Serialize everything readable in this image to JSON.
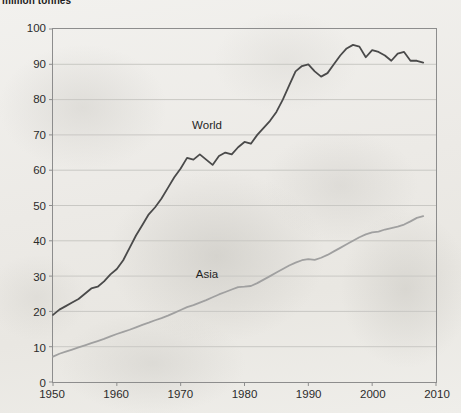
{
  "chart": {
    "title": "million tonnes"
  },
  "labels": {
    "world": "World",
    "asia": "Asia"
  },
  "colors": {
    "world_line": "#4a4a4a",
    "asia_line": "#a0a0a0",
    "gridline": "#c9c8c4",
    "axis": "#8d8d8d",
    "text": "#2b2b2b"
  },
  "chart_data": {
    "type": "line",
    "title": "million tonnes",
    "xlabel": "",
    "ylabel": "million tonnes",
    "xlim": [
      1950,
      2010
    ],
    "ylim": [
      0,
      100
    ],
    "xticks": [
      1950,
      1960,
      1970,
      1980,
      1990,
      2000,
      2010
    ],
    "yticks": [
      0,
      10,
      20,
      30,
      40,
      50,
      60,
      70,
      80,
      90,
      100
    ],
    "grid": true,
    "legend": "inline-annotation",
    "x": [
      1950,
      1951,
      1952,
      1953,
      1954,
      1955,
      1956,
      1957,
      1958,
      1959,
      1960,
      1961,
      1962,
      1963,
      1964,
      1965,
      1966,
      1967,
      1968,
      1969,
      1970,
      1971,
      1972,
      1973,
      1974,
      1975,
      1976,
      1977,
      1978,
      1979,
      1980,
      1981,
      1982,
      1983,
      1984,
      1985,
      1986,
      1987,
      1988,
      1989,
      1990,
      1991,
      1992,
      1993,
      1994,
      1995,
      1996,
      1997,
      1998,
      1999,
      2000,
      2001,
      2002,
      2003,
      2004,
      2005,
      2006,
      2007,
      2008
    ],
    "series": [
      {
        "name": "World",
        "color": "#4a4a4a",
        "values": [
          19.0,
          20.5,
          21.5,
          22.5,
          23.5,
          25.0,
          26.5,
          27.0,
          28.5,
          30.5,
          32.0,
          34.5,
          38.0,
          41.5,
          44.5,
          47.5,
          49.5,
          52.0,
          55.0,
          58.0,
          60.5,
          63.5,
          63.0,
          64.5,
          63.0,
          61.5,
          64.0,
          65.0,
          64.5,
          66.5,
          68.0,
          67.5,
          70.0,
          72.0,
          74.0,
          76.5,
          80.0,
          84.0,
          88.0,
          89.5,
          90.0,
          88.0,
          86.5,
          87.5,
          90.0,
          92.5,
          94.5,
          95.5,
          95.0,
          92.0,
          94.0,
          93.5,
          92.5,
          91.0,
          93.0,
          93.5,
          91.0,
          91.0,
          90.5
        ]
      },
      {
        "name": "Asia",
        "color": "#a0a0a0",
        "values": [
          7.2,
          8.0,
          8.6,
          9.2,
          9.8,
          10.4,
          11.0,
          11.6,
          12.2,
          12.9,
          13.6,
          14.2,
          14.8,
          15.5,
          16.2,
          16.8,
          17.5,
          18.1,
          18.8,
          19.6,
          20.4,
          21.2,
          21.8,
          22.5,
          23.2,
          24.0,
          24.8,
          25.5,
          26.2,
          26.9,
          27.0,
          27.2,
          28.0,
          29.0,
          30.0,
          31.0,
          32.0,
          33.0,
          33.8,
          34.5,
          34.8,
          34.6,
          35.2,
          36.0,
          37.0,
          38.0,
          39.0,
          40.0,
          41.0,
          41.8,
          42.4,
          42.6,
          43.2,
          43.6,
          44.0,
          44.6,
          45.5,
          46.5,
          47.0
        ]
      }
    ],
    "annotations": [
      {
        "text": "World",
        "x": 1974,
        "y": 73
      },
      {
        "text": "Asia",
        "x": 1974,
        "y": 31
      }
    ]
  }
}
